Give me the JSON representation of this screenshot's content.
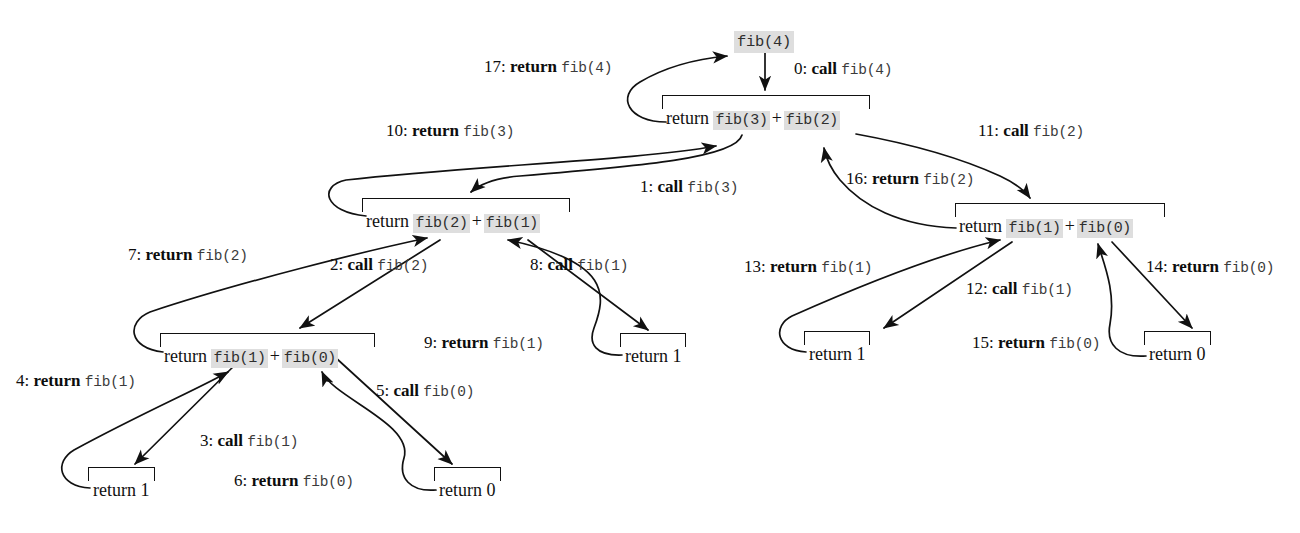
{
  "diagram": {
    "type": "recursion-tree",
    "accent_shade": "#dedede",
    "ink": "#111111"
  },
  "root": {
    "label": "fib(4)"
  },
  "frames": [
    {
      "id": "frame-fib4",
      "return_word": "return",
      "left_call": "fib(3)",
      "operator": "+",
      "right_call": "fib(2)"
    },
    {
      "id": "frame-fib3",
      "return_word": "return",
      "left_call": "fib(2)",
      "operator": "+",
      "right_call": "fib(1)"
    },
    {
      "id": "frame-fib2-left",
      "return_word": "return",
      "left_call": "fib(1)",
      "operator": "+",
      "right_call": "fib(0)"
    },
    {
      "id": "frame-fib2-right",
      "return_word": "return",
      "left_call": "fib(1)",
      "operator": "+",
      "right_call": "fib(0)"
    }
  ],
  "leaves": [
    {
      "id": "leaf-return-1-a",
      "text": "return 1"
    },
    {
      "id": "leaf-return-0-a",
      "text": "return 0"
    },
    {
      "id": "leaf-return-1-b",
      "text": "return 1"
    },
    {
      "id": "leaf-return-1-c",
      "text": "return 1"
    },
    {
      "id": "leaf-return-0-b",
      "text": "return 0"
    }
  ],
  "edge_labels": [
    {
      "id": "edge-0",
      "num": "0:",
      "kw": "call",
      "code": "fib(4)"
    },
    {
      "id": "edge-1",
      "num": "1:",
      "kw": "call",
      "code": "fib(3)"
    },
    {
      "id": "edge-2",
      "num": "2:",
      "kw": "call",
      "code": "fib(2)"
    },
    {
      "id": "edge-3",
      "num": "3:",
      "kw": "call",
      "code": "fib(1)"
    },
    {
      "id": "edge-4",
      "num": "4:",
      "kw": "return",
      "code": "fib(1)"
    },
    {
      "id": "edge-5",
      "num": "5:",
      "kw": "call",
      "code": "fib(0)"
    },
    {
      "id": "edge-6",
      "num": "6:",
      "kw": "return",
      "code": "fib(0)"
    },
    {
      "id": "edge-7",
      "num": "7:",
      "kw": "return",
      "code": "fib(2)"
    },
    {
      "id": "edge-8",
      "num": "8:",
      "kw": "call",
      "code": "fib(1)"
    },
    {
      "id": "edge-9",
      "num": "9:",
      "kw": "return",
      "code": "fib(1)"
    },
    {
      "id": "edge-10",
      "num": "10:",
      "kw": "return",
      "code": "fib(3)"
    },
    {
      "id": "edge-11",
      "num": "11:",
      "kw": "call",
      "code": "fib(2)"
    },
    {
      "id": "edge-12",
      "num": "12:",
      "kw": "call",
      "code": "fib(1)"
    },
    {
      "id": "edge-13",
      "num": "13:",
      "kw": "return",
      "code": "fib(1)"
    },
    {
      "id": "edge-14",
      "num": "14:",
      "kw": "return",
      "code": "fib(0)"
    },
    {
      "id": "edge-15",
      "num": "15:",
      "kw": "return",
      "code": "fib(0)"
    },
    {
      "id": "edge-16",
      "num": "16:",
      "kw": "return",
      "code": "fib(2)"
    },
    {
      "id": "edge-17",
      "num": "17:",
      "kw": "return",
      "code": "fib(4)"
    }
  ]
}
